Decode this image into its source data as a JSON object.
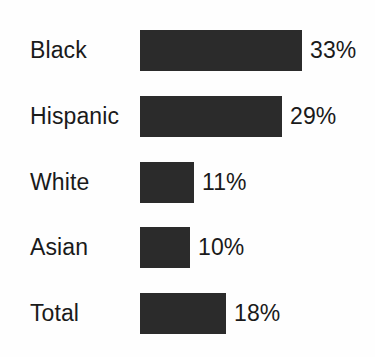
{
  "chart_data": {
    "type": "bar",
    "orientation": "horizontal",
    "title": "",
    "xlabel": "",
    "ylabel": "",
    "grid": false,
    "legend": false,
    "axes_visible": false,
    "value_suffix": "%",
    "categories": [
      "Black",
      "Hispanic",
      "White",
      "Asian",
      "Total"
    ],
    "values": [
      33,
      29,
      11,
      10,
      18
    ],
    "value_labels": [
      "33%",
      "29%",
      "11%",
      "10%",
      "18%"
    ],
    "xlim": [
      0,
      33
    ],
    "colors": {
      "bar": "#2b2b2b",
      "background": "#fefefe",
      "text": "#1a1a1a"
    },
    "bars": [
      {
        "category": "Black",
        "value": 33,
        "value_label": "33%",
        "bar_width_px": 162
      },
      {
        "category": "Hispanic",
        "value": 29,
        "value_label": "29%",
        "bar_width_px": 142
      },
      {
        "category": "White",
        "value": 11,
        "value_label": "11%",
        "bar_width_px": 54
      },
      {
        "category": "Asian",
        "value": 10,
        "value_label": "10%",
        "bar_width_px": 50
      },
      {
        "category": "Total",
        "value": 18,
        "value_label": "18%",
        "bar_width_px": 86
      }
    ]
  }
}
